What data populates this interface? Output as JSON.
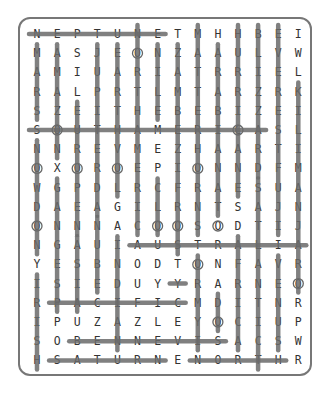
{
  "puzzle": {
    "title": "",
    "rows": [
      "NEPTUNETMHHBEI",
      "MASJEONZAAULVW",
      "AMIUARIATRRIEL",
      "RALPRTLMTARZRK",
      "SZEITHEBEBIZEI",
      "SOUTHAMERICASL",
      "NNREVMEZHAARTI",
      "OXOROEPIONNDFM",
      "WGPDLRCFRAESUA",
      "DAEAGILRNTSAJN",
      "ONNNACOOSODTIJ",
      "NGAUIAUSTRALIA",
      "YESBNODTONFAVR",
      "ISIEDUYYRARNEO",
      "RPACIFICMDITNR",
      "IPUZAZLEYOCIUP",
      "SOBENNEVISACSW",
      "HSATURNENORTHR"
    ],
    "found_lines": [
      {
        "word": "NEPTUNE",
        "r1": 0,
        "c1": 0,
        "r2": 0,
        "c2": 6
      },
      {
        "word": "SOUTHAMERICA",
        "r1": 5,
        "c1": 0,
        "r2": 5,
        "c2": 11
      },
      {
        "word": "AUSTRALIA",
        "r1": 11,
        "c1": 5,
        "r2": 11,
        "c2": 13
      },
      {
        "word": "PACIFIC",
        "r1": 14,
        "c1": 1,
        "r2": 14,
        "c2": 7
      },
      {
        "word": "BENNEVIS",
        "r1": 16,
        "c1": 2,
        "r2": 16,
        "c2": 9
      },
      {
        "word": "SATURN",
        "r1": 17,
        "c1": 1,
        "r2": 17,
        "c2": 6
      },
      {
        "word": "NORTH",
        "r1": 17,
        "c1": 8,
        "r2": 17,
        "c2": 12
      },
      {
        "word": "col0a",
        "r1": 1,
        "c1": 0,
        "r2": 4,
        "c2": 0
      },
      {
        "word": "col0b",
        "r1": 6,
        "c1": 0,
        "r2": 11,
        "c2": 0
      },
      {
        "word": "col0c",
        "r1": 13,
        "c1": 0,
        "r2": 17,
        "c2": 0
      },
      {
        "word": "col1a",
        "r1": 1,
        "c1": 1,
        "r2": 6,
        "c2": 1
      },
      {
        "word": "col1b",
        "r1": 8,
        "c1": 1,
        "r2": 14,
        "c2": 1
      },
      {
        "word": "col2a",
        "r1": 4,
        "c1": 2,
        "r2": 10,
        "c2": 2
      },
      {
        "word": "col2b",
        "r1": 11,
        "c1": 2,
        "r2": 14,
        "c2": 2
      },
      {
        "word": "col3a",
        "r1": 1,
        "c1": 3,
        "r2": 9,
        "c2": 3
      },
      {
        "word": "col3b",
        "r1": 10,
        "c1": 3,
        "r2": 13,
        "c2": 3
      },
      {
        "word": "col4a",
        "r1": 1,
        "c1": 4,
        "r2": 8,
        "c2": 4
      },
      {
        "word": "col4b",
        "r1": 11,
        "c1": 4,
        "r2": 16,
        "c2": 4
      },
      {
        "word": "col5a",
        "r1": 0,
        "c1": 5,
        "r2": 10,
        "c2": 5
      },
      {
        "word": "col6a",
        "r1": 1,
        "c1": 6,
        "r2": 4,
        "c2": 6
      },
      {
        "word": "col6b",
        "r1": 8,
        "c1": 6,
        "r2": 10,
        "c2": 6
      },
      {
        "word": "col7a",
        "r1": 1,
        "c1": 7,
        "r2": 11,
        "c2": 7
      },
      {
        "word": "col7b",
        "r1": 13,
        "c1": 7,
        "r2": 13,
        "c2": 7
      },
      {
        "word": "col8a",
        "r1": 0,
        "c1": 8,
        "r2": 10,
        "c2": 8
      },
      {
        "word": "col8b",
        "r1": 12,
        "c1": 8,
        "r2": 16,
        "c2": 8
      },
      {
        "word": "col9a",
        "r1": 1,
        "c1": 9,
        "r2": 9,
        "c2": 9
      },
      {
        "word": "col9b",
        "r1": 14,
        "c1": 9,
        "r2": 15,
        "c2": 9
      },
      {
        "word": "col10a",
        "r1": 0,
        "c1": 10,
        "r2": 8,
        "c2": 10
      },
      {
        "word": "col10b",
        "r1": 11,
        "c1": 10,
        "r2": 16,
        "c2": 10
      },
      {
        "word": "col11a",
        "r1": 0,
        "c1": 11,
        "r2": 7,
        "c2": 11
      },
      {
        "word": "col11b",
        "r1": 8,
        "c1": 11,
        "r2": 17,
        "c2": 11
      },
      {
        "word": "col12a",
        "r1": 0,
        "c1": 12,
        "r2": 10,
        "c2": 12
      },
      {
        "word": "col12b",
        "r1": 12,
        "c1": 12,
        "r2": 16,
        "c2": 12
      },
      {
        "word": "col13a",
        "r1": 3,
        "c1": 13,
        "r2": 13,
        "c2": 13
      }
    ],
    "circled_cells": [
      [
        1,
        5
      ],
      [
        5,
        1
      ],
      [
        7,
        0
      ],
      [
        7,
        2
      ],
      [
        7,
        4
      ],
      [
        7,
        8
      ],
      [
        10,
        0
      ],
      [
        10,
        6
      ],
      [
        10,
        7
      ],
      [
        10,
        9
      ],
      [
        12,
        8
      ],
      [
        13,
        13
      ],
      [
        15,
        9
      ],
      [
        5,
        10
      ]
    ]
  }
}
